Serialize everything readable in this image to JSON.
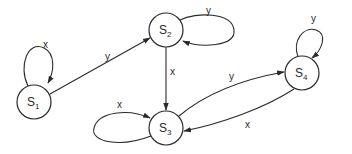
{
  "diagram": {
    "type": "state-transition-diagram",
    "states": [
      {
        "id": "S1",
        "name": "S",
        "subscript": "1",
        "cx": 34,
        "cy": 102
      },
      {
        "id": "S2",
        "name": "S",
        "subscript": "2",
        "cx": 166,
        "cy": 30
      },
      {
        "id": "S3",
        "name": "S",
        "subscript": "3",
        "cx": 166,
        "cy": 128
      },
      {
        "id": "S4",
        "name": "S",
        "subscript": "4",
        "cx": 302,
        "cy": 73
      }
    ],
    "transitions": [
      {
        "from": "S1",
        "to": "S1",
        "label": "x"
      },
      {
        "from": "S1",
        "to": "S2",
        "label": "y"
      },
      {
        "from": "S2",
        "to": "S2",
        "label": "y"
      },
      {
        "from": "S2",
        "to": "S3",
        "label": "x"
      },
      {
        "from": "S3",
        "to": "S3",
        "label": "x"
      },
      {
        "from": "S3",
        "to": "S4",
        "label": "y"
      },
      {
        "from": "S4",
        "to": "S3",
        "label": "x"
      },
      {
        "from": "S4",
        "to": "S4",
        "label": "y"
      }
    ],
    "colors": {
      "stroke": "#2a2a2a",
      "fill": "#ffffff"
    }
  }
}
